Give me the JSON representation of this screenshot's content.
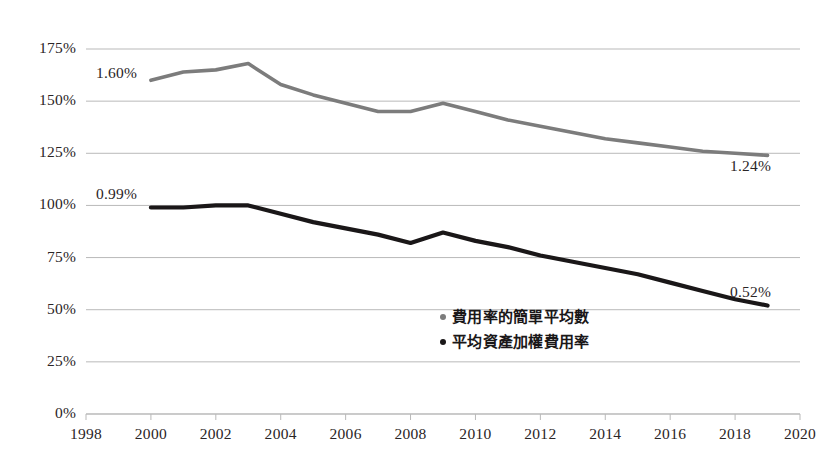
{
  "chart_data": {
    "type": "line",
    "title": "",
    "subtitle": "",
    "xlabel": "",
    "ylabel": "",
    "xlim": [
      1998,
      2020
    ],
    "ylim": [
      0,
      175
    ],
    "grid": true,
    "legend_position": "inside-bottom-center",
    "x_ticks": [
      "1998",
      "2000",
      "2002",
      "2004",
      "2006",
      "2008",
      "2010",
      "2012",
      "2014",
      "2016",
      "2018",
      "2020"
    ],
    "y_ticks": [
      "0%",
      "25%",
      "50%",
      "75%",
      "100%",
      "125%",
      "150%",
      "175%"
    ],
    "x": [
      2000,
      2001,
      2002,
      2003,
      2004,
      2005,
      2006,
      2007,
      2008,
      2009,
      2010,
      2011,
      2012,
      2013,
      2014,
      2015,
      2016,
      2017,
      2018,
      2019
    ],
    "series": [
      {
        "name": "費用率的簡單平均數",
        "color": "#7c7c7c",
        "values": [
          160,
          164,
          165,
          168,
          158,
          153,
          149,
          145,
          145,
          149,
          145,
          141,
          138,
          135,
          132,
          130,
          128,
          126,
          125,
          124
        ],
        "start_label": "1.60%",
        "end_label": "1.24%"
      },
      {
        "name": "平均資產加權費用率",
        "color": "#1a1718",
        "values": [
          99,
          99,
          100,
          100,
          96,
          92,
          89,
          86,
          82,
          87,
          83,
          80,
          76,
          73,
          70,
          67,
          63,
          59,
          55,
          52
        ],
        "start_label": "0.99%",
        "end_label": "0.52%"
      }
    ],
    "annotations": [
      {
        "text": "1.60%",
        "series": "費用率的簡單平均數",
        "position": "start"
      },
      {
        "text": "1.24%",
        "series": "費用率的簡單平均數",
        "position": "end"
      },
      {
        "text": "0.99%",
        "series": "平均資產加權費用率",
        "position": "start"
      },
      {
        "text": "0.52%",
        "series": "平均資產加權費用率",
        "position": "end"
      }
    ]
  },
  "legend": {
    "items": [
      {
        "label": "費用率的簡單平均數",
        "color": "#7c7c7c"
      },
      {
        "label": "平均資產加權費用率",
        "color": "#1a1718"
      }
    ]
  },
  "axis": {
    "y_labels": [
      "175%",
      "150%",
      "125%",
      "100%",
      "75%",
      "50%",
      "25%",
      "0%"
    ],
    "x_labels": [
      "1998",
      "2000",
      "2002",
      "2004",
      "2006",
      "2008",
      "2010",
      "2012",
      "2014",
      "2016",
      "2018",
      "2020"
    ]
  },
  "labels": {
    "gray_start": "1.60%",
    "gray_end": "1.24%",
    "black_start": "0.99%",
    "black_end": "0.52%"
  },
  "colors": {
    "gray_series": "#7c7c7c",
    "black_series": "#1a1718",
    "gridline": "#b9b9b9",
    "text": "#2a2526",
    "background": "#ffffff"
  }
}
